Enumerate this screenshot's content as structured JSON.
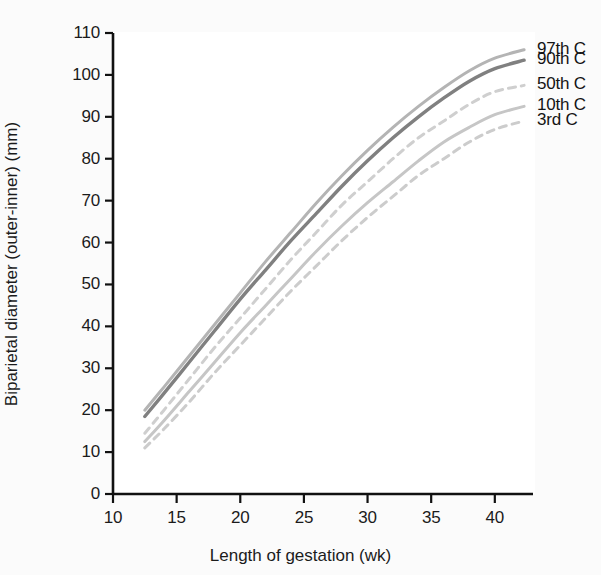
{
  "figure": {
    "background_color": "#fbfbfb",
    "plot_background_color": "#ffffff"
  },
  "chart_data": {
    "type": "line",
    "title": "",
    "xlabel": "Length of gestation (wk)",
    "ylabel": "Biparietal diameter (outer-inner) (mm)",
    "xlim": [
      10,
      43
    ],
    "ylim": [
      0,
      110
    ],
    "xticks": [
      10,
      15,
      20,
      25,
      30,
      35,
      40
    ],
    "yticks": [
      0,
      10,
      20,
      30,
      40,
      50,
      60,
      70,
      80,
      90,
      100,
      110
    ],
    "grid": false,
    "legend_position": "right-inline-labels",
    "x": [
      12.5,
      14,
      16,
      18,
      20,
      22,
      24,
      26,
      28,
      30,
      32,
      34,
      36,
      38,
      40,
      42.3
    ],
    "series": [
      {
        "name": "97th C",
        "label": "97th C",
        "color": "#b4b4b4",
        "style": "solid",
        "width": 3.0,
        "values": [
          20.0,
          25.5,
          33.0,
          40.5,
          48.0,
          55.5,
          62.5,
          69.5,
          76.0,
          82.0,
          87.5,
          92.5,
          97.0,
          101.0,
          104.0,
          106.0
        ]
      },
      {
        "name": "90th C",
        "label": "90th C",
        "color": "#808080",
        "style": "solid",
        "width": 3.4,
        "values": [
          18.5,
          24.0,
          31.5,
          39.0,
          46.5,
          53.5,
          60.5,
          67.0,
          73.5,
          79.5,
          85.0,
          90.0,
          94.5,
          98.5,
          101.5,
          103.5
        ]
      },
      {
        "name": "50th C",
        "label": "50th C",
        "color": "#cfcfcf",
        "style": "dashed",
        "width": 3.0,
        "values": [
          14.5,
          20.0,
          27.5,
          35.0,
          42.0,
          49.0,
          56.0,
          62.5,
          69.0,
          74.5,
          80.0,
          85.0,
          89.0,
          93.0,
          96.0,
          97.5
        ]
      },
      {
        "name": "10th C",
        "label": "10th C",
        "color": "#c6c6c6",
        "style": "solid",
        "width": 3.0,
        "values": [
          12.5,
          17.5,
          24.5,
          31.5,
          38.5,
          45.0,
          51.5,
          58.0,
          64.0,
          69.5,
          74.5,
          79.5,
          84.0,
          87.5,
          90.5,
          92.5
        ]
      },
      {
        "name": "3rd C",
        "label": "3rd C",
        "color": "#cccccc",
        "style": "dashed",
        "width": 3.0,
        "values": [
          11.0,
          15.5,
          22.0,
          29.0,
          35.5,
          42.0,
          48.5,
          54.5,
          60.5,
          66.0,
          71.0,
          76.0,
          80.0,
          84.0,
          87.0,
          89.0
        ]
      }
    ]
  },
  "axis": {
    "x_title": "Length of gestation (wk)",
    "y_title": "Biparietal diameter (outer-inner) (mm)",
    "x_tick_labels": [
      "10",
      "15",
      "20",
      "25",
      "30",
      "35",
      "40"
    ],
    "y_tick_labels": [
      "0",
      "10",
      "20",
      "30",
      "40",
      "50",
      "60",
      "70",
      "80",
      "90",
      "100",
      "110"
    ]
  },
  "series_labels": [
    {
      "text": "97th C",
      "y_mm": 106.0
    },
    {
      "text": "90th C",
      "y_mm": 103.5
    },
    {
      "text": "50th C",
      "y_mm": 97.5
    },
    {
      "text": "10th C",
      "y_mm": 92.5
    },
    {
      "text": "3rd C",
      "y_mm": 89.0
    }
  ]
}
